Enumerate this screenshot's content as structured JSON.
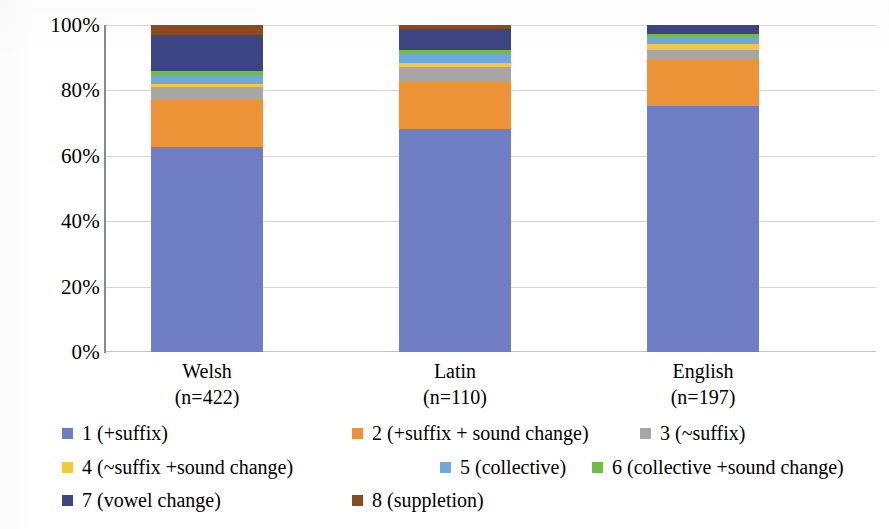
{
  "chart_data": {
    "type": "bar",
    "subtype": "stacked-100-percent",
    "title": "",
    "xlabel": "",
    "ylabel": "",
    "ylim": [
      0,
      100
    ],
    "y_tick_labels": [
      "0%",
      "20%",
      "40%",
      "60%",
      "80%",
      "100%"
    ],
    "y_ticks": [
      0,
      20,
      40,
      60,
      80,
      100
    ],
    "grid": true,
    "grid_axis": "y",
    "legend_position": "bottom",
    "categories": [
      "Welsh",
      "Latin",
      "English"
    ],
    "category_sublabels": [
      "(n=422)",
      "(n=110)",
      "(n=197)"
    ],
    "category_counts": [
      422,
      110,
      197
    ],
    "series": [
      {
        "name": "1 (+suffix)",
        "color": "#6f7ec4",
        "values": [
          62.7,
          68.2,
          75.2
        ]
      },
      {
        "name": "2 (+suffix + sound change)",
        "color": "#ed9337",
        "values": [
          14.4,
          14.7,
          14.1
        ]
      },
      {
        "name": "3 (~suffix)",
        "color": "#a6a6a6",
        "values": [
          4.0,
          4.3,
          3.1
        ]
      },
      {
        "name": "4 (~suffix +sound change)",
        "color": "#f5c842",
        "values": [
          0.9,
          1.2,
          1.8
        ]
      },
      {
        "name": "5 (collective)",
        "color": "#6fa8dc",
        "values": [
          2.8,
          2.8,
          1.8
        ]
      },
      {
        "name": "6 (collective +sound change)",
        "color": "#6fbe44",
        "values": [
          1.2,
          1.2,
          1.2
        ]
      },
      {
        "name": "7 (vowel change)",
        "color": "#3c4484",
        "values": [
          11.0,
          6.4,
          2.8
        ]
      },
      {
        "name": "8 (suppletion)",
        "color": "#8a4b22",
        "values": [
          3.0,
          1.2,
          0.0
        ]
      }
    ]
  },
  "legend": {
    "rows": [
      [
        {
          "label": "1 (+suffix)",
          "color": "#6f7ec4"
        },
        {
          "label": "2 (+suffix + sound change)",
          "color": "#ed9337"
        },
        {
          "label": "3 (~suffix)",
          "color": "#a6a6a6"
        }
      ],
      [
        {
          "label": "4 (~suffix +sound change)",
          "color": "#f5c842"
        },
        {
          "label": "5 (collective)",
          "color": "#6fa8dc"
        },
        {
          "label": "6 (collective +sound change)",
          "color": "#6fbe44"
        }
      ],
      [
        {
          "label": "7 (vowel change)",
          "color": "#3c4484"
        },
        {
          "label": "8 (suppletion)",
          "color": "#8a4b22"
        }
      ]
    ]
  }
}
